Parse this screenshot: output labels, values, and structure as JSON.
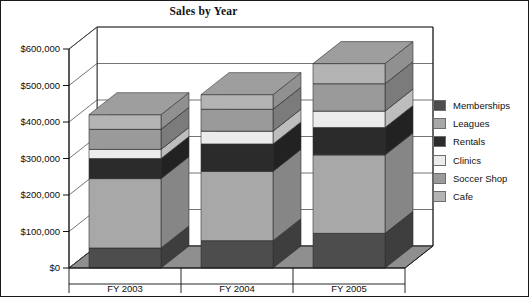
{
  "chart_data": {
    "type": "bar",
    "subtype": "stacked-column-3d",
    "title": "Sales by Year",
    "xlabel": "",
    "ylabel": "",
    "categories": [
      "FY 2003",
      "FY 2004",
      "FY 2005"
    ],
    "ylim": [
      0,
      600000
    ],
    "ytick_values": [
      0,
      100000,
      200000,
      300000,
      400000,
      500000,
      600000
    ],
    "ytick_labels": [
      "$0",
      "$100,000",
      "$200,000",
      "$300,000",
      "$400,000",
      "$500,000",
      "$600,000"
    ],
    "grid": true,
    "legend_position": "right",
    "stack_order_bottom_to_top": [
      "Memberships",
      "Leagues",
      "Rentals",
      "Clinics",
      "Soccer Shop",
      "Cafe"
    ],
    "series": [
      {
        "name": "Memberships",
        "color": "#4d4d4d",
        "values": [
          55000,
          75000,
          95000
        ]
      },
      {
        "name": "Leagues",
        "color": "#a8a8a8",
        "values": [
          190000,
          190000,
          215000
        ]
      },
      {
        "name": "Rentals",
        "color": "#2b2b2b",
        "values": [
          55000,
          75000,
          75000
        ]
      },
      {
        "name": "Clinics",
        "color": "#ececec",
        "values": [
          25000,
          35000,
          45000
        ]
      },
      {
        "name": "Soccer Shop",
        "color": "#9a9a9a",
        "values": [
          55000,
          60000,
          75000
        ]
      },
      {
        "name": "Cafe",
        "color": "#b4b4b4",
        "values": [
          40000,
          40000,
          55000
        ]
      }
    ],
    "totals": [
      420000,
      475000,
      560000
    ]
  },
  "legend": {
    "items": [
      {
        "label": "Memberships",
        "color": "#4d4d4d"
      },
      {
        "label": "Leagues",
        "color": "#a8a8a8"
      },
      {
        "label": "Rentals",
        "color": "#2b2b2b"
      },
      {
        "label": "Clinics",
        "color": "#ececec"
      },
      {
        "label": "Soccer Shop",
        "color": "#9a9a9a"
      },
      {
        "label": "Cafe",
        "color": "#b4b4b4"
      }
    ]
  },
  "colors": {
    "floor": "#8f8f8f",
    "wall": "#ffffff",
    "gridline": "#3a3a3a",
    "axis": "#111111",
    "border": "#1a1a1a"
  }
}
